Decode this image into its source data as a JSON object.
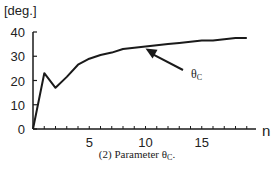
{
  "chart_data": {
    "type": "line",
    "title": "",
    "caption": "(2)  Parameter θC.",
    "caption_prefix": "(2)  Parameter θ",
    "caption_sub": "C",
    "caption_suffix": ".",
    "xlabel": "n",
    "ylabel": "[deg.]",
    "xlim": [
      0,
      20
    ],
    "ylim": [
      0,
      40
    ],
    "x_ticks": [
      5,
      10,
      15
    ],
    "y_ticks": [
      0,
      10,
      20,
      30,
      40
    ],
    "x_minor_ticks_every": 1,
    "grid": false,
    "legend": null,
    "annotations": [
      {
        "text": "θC",
        "base": "θ",
        "sub": "C",
        "arrow_to": {
          "n": 10,
          "value": 34
        }
      }
    ],
    "series": [
      {
        "name": "θC",
        "x": [
          0,
          1,
          2,
          3,
          4,
          5,
          6,
          7,
          8,
          9,
          10,
          11,
          12,
          13,
          14,
          15,
          16,
          17,
          18,
          19
        ],
        "values": [
          0,
          23,
          17,
          21.5,
          26.5,
          29,
          30.5,
          31.5,
          33,
          33.5,
          34,
          34.5,
          35,
          35.5,
          36,
          36.5,
          36.5,
          37,
          37.5,
          37.5
        ]
      }
    ]
  }
}
